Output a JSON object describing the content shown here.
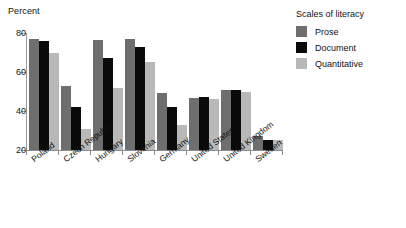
{
  "chart_data": {
    "type": "bar",
    "title": "",
    "ylabel": "Percent",
    "xlabel": "",
    "ylim": [
      20,
      80
    ],
    "yticks": [
      20,
      40,
      60,
      80
    ],
    "grid": false,
    "legend_position": "right",
    "legend_title": "Scales of literacy",
    "categories": [
      "Poland",
      "Czech Republic",
      "Hungary",
      "Slovenia",
      "Germany",
      "United States",
      "United Kingdom",
      "Sweden"
    ],
    "series": [
      {
        "name": "Prose",
        "color": "#6e6e6e",
        "values": [
          77,
          53,
          76.5,
          77,
          49,
          46.5,
          51,
          27
        ]
      },
      {
        "name": "Document",
        "color": "#0a0a0a",
        "values": [
          76,
          42,
          67,
          73,
          42,
          47,
          51,
          25
        ]
      },
      {
        "name": "Quantitative",
        "color": "#b8b8b8",
        "values": [
          69.5,
          31,
          52,
          65,
          33,
          46,
          50,
          25
        ]
      }
    ]
  },
  "axis": {
    "y_label": "Percent",
    "y_tick_labels": [
      "80",
      "60",
      "40",
      "20"
    ]
  },
  "legend": {
    "title": "Scales of literacy",
    "items": [
      {
        "label": "Prose",
        "color": "#6e6e6e"
      },
      {
        "label": "Document",
        "color": "#0a0a0a"
      },
      {
        "label": "Quantitative",
        "color": "#b8b8b8"
      }
    ]
  }
}
